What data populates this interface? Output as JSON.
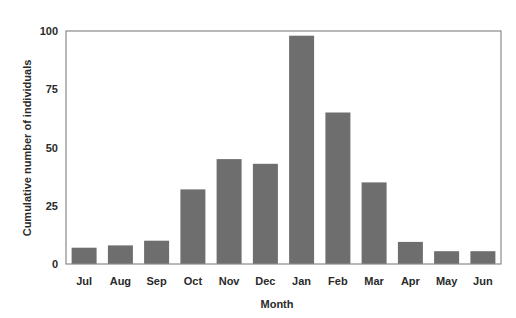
{
  "chart_data": {
    "type": "bar",
    "title": "",
    "xlabel": "Month",
    "ylabel": "Cumulative number of individuals",
    "categories": [
      "Jul",
      "Aug",
      "Sep",
      "Oct",
      "Nov",
      "Dec",
      "Jan",
      "Feb",
      "Mar",
      "Apr",
      "May",
      "Jun"
    ],
    "values": [
      7,
      8,
      10,
      32,
      45,
      43,
      98,
      65,
      35,
      9.5,
      5.5,
      5.5
    ],
    "ylim": [
      0,
      100
    ],
    "yticks": [
      0,
      25,
      50,
      75,
      100
    ],
    "grid": false,
    "legend": null,
    "bar_color": "#6e6e6e",
    "frame_color": "#8a8a8a"
  }
}
